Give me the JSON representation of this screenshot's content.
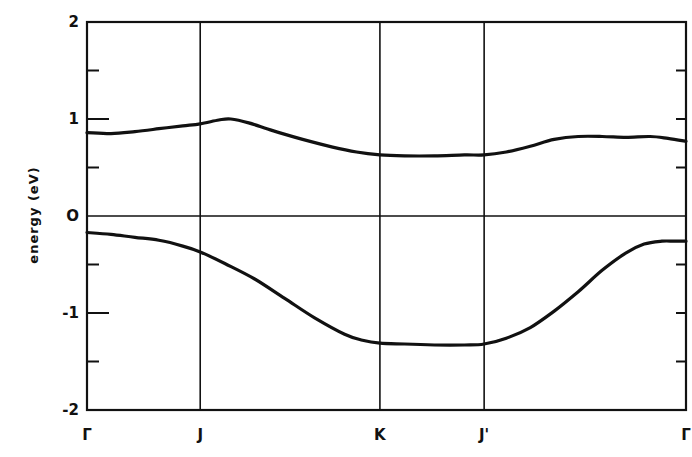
{
  "chart_data": {
    "type": "line",
    "title": "",
    "xlabel": "",
    "ylabel": "energy (eV)",
    "ylim": [
      -2,
      2
    ],
    "yticks_major": [
      -2,
      -1,
      0,
      1,
      2
    ],
    "yticks_minor": [
      -1.5,
      -0.5,
      0.5,
      1.5
    ],
    "ytick_labels": [
      "-2",
      "-1",
      "O",
      "1",
      "2"
    ],
    "xlim": [
      0,
      1
    ],
    "k_points": [
      {
        "label": "Γ",
        "x": 0.0
      },
      {
        "label": "J",
        "x": 0.189
      },
      {
        "label": "K",
        "x": 0.489
      },
      {
        "label": "J'",
        "x": 0.663
      },
      {
        "label": "Γ",
        "x": 1.0
      }
    ],
    "zero_line": 0,
    "grid": "vertical lines at high-symmetry points",
    "legend": "none",
    "series": [
      {
        "name": "upper band",
        "x": [
          0.0,
          0.04,
          0.08,
          0.12,
          0.16,
          0.189,
          0.22,
          0.24,
          0.27,
          0.31,
          0.36,
          0.41,
          0.45,
          0.489,
          0.53,
          0.58,
          0.63,
          0.663,
          0.7,
          0.74,
          0.78,
          0.82,
          0.86,
          0.9,
          0.94,
          0.97,
          1.0
        ],
        "values": [
          0.86,
          0.85,
          0.87,
          0.9,
          0.93,
          0.95,
          0.99,
          1.0,
          0.96,
          0.88,
          0.79,
          0.71,
          0.66,
          0.63,
          0.62,
          0.62,
          0.63,
          0.63,
          0.66,
          0.72,
          0.79,
          0.82,
          0.82,
          0.81,
          0.82,
          0.8,
          0.77
        ]
      },
      {
        "name": "lower band",
        "x": [
          0.0,
          0.04,
          0.08,
          0.12,
          0.16,
          0.189,
          0.23,
          0.28,
          0.33,
          0.38,
          0.43,
          0.46,
          0.489,
          0.53,
          0.58,
          0.63,
          0.663,
          0.7,
          0.74,
          0.78,
          0.82,
          0.86,
          0.9,
          0.93,
          0.96,
          0.98,
          1.0
        ],
        "values": [
          -0.17,
          -0.19,
          -0.22,
          -0.25,
          -0.31,
          -0.37,
          -0.49,
          -0.65,
          -0.85,
          -1.05,
          -1.22,
          -1.28,
          -1.31,
          -1.32,
          -1.33,
          -1.33,
          -1.32,
          -1.26,
          -1.15,
          -0.98,
          -0.78,
          -0.56,
          -0.38,
          -0.29,
          -0.26,
          -0.26,
          -0.26
        ]
      }
    ]
  }
}
